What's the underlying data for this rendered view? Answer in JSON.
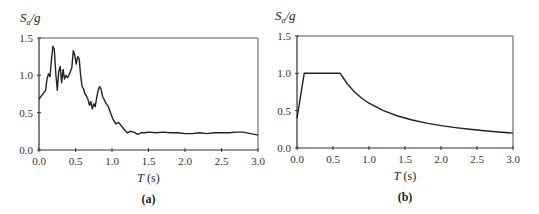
{
  "chart_data": [
    {
      "type": "line",
      "panel_label": "(a)",
      "ylabel": "Sa/g",
      "ylabel_main": "S",
      "ylabel_sub": "a",
      "ylabel_rest": "/g",
      "xlabel_italic": "T",
      "xlabel_rest": " (s)",
      "xlim": [
        0,
        3.0
      ],
      "ylim": [
        0,
        1.5
      ],
      "xticks": [
        "0.0",
        "0.5",
        "1.0",
        "1.5",
        "2.0",
        "2.5",
        "3.0"
      ],
      "yticks": [
        "0.0",
        "0.5",
        "1.0",
        "1.5"
      ],
      "grid": false,
      "x": [
        0.0,
        0.03,
        0.06,
        0.09,
        0.11,
        0.13,
        0.15,
        0.17,
        0.19,
        0.21,
        0.23,
        0.25,
        0.27,
        0.29,
        0.31,
        0.33,
        0.35,
        0.37,
        0.39,
        0.41,
        0.43,
        0.45,
        0.47,
        0.49,
        0.51,
        0.53,
        0.55,
        0.57,
        0.59,
        0.61,
        0.63,
        0.65,
        0.67,
        0.69,
        0.71,
        0.73,
        0.75,
        0.77,
        0.79,
        0.81,
        0.83,
        0.85,
        0.87,
        0.89,
        0.92,
        0.95,
        0.98,
        1.01,
        1.05,
        1.09,
        1.13,
        1.17,
        1.21,
        1.25,
        1.3,
        1.35,
        1.4,
        1.45,
        1.5,
        1.6,
        1.7,
        1.8,
        1.9,
        2.0,
        2.1,
        2.2,
        2.3,
        2.4,
        2.5,
        2.6,
        2.7,
        2.8,
        2.9,
        3.0
      ],
      "values": [
        0.68,
        0.72,
        0.76,
        0.8,
        0.95,
        1.02,
        0.98,
        1.2,
        1.39,
        1.35,
        1.02,
        0.8,
        1.05,
        1.12,
        0.9,
        1.08,
        0.95,
        1.0,
        0.97,
        1.0,
        1.05,
        1.1,
        1.33,
        1.27,
        1.15,
        1.25,
        1.22,
        1.0,
        0.85,
        0.82,
        0.75,
        0.72,
        0.68,
        0.6,
        0.65,
        0.55,
        0.62,
        0.58,
        0.7,
        0.8,
        0.85,
        0.82,
        0.72,
        0.68,
        0.62,
        0.58,
        0.5,
        0.42,
        0.35,
        0.37,
        0.32,
        0.27,
        0.23,
        0.25,
        0.24,
        0.21,
        0.23,
        0.23,
        0.24,
        0.23,
        0.24,
        0.23,
        0.23,
        0.22,
        0.22,
        0.23,
        0.22,
        0.23,
        0.23,
        0.23,
        0.24,
        0.24,
        0.22,
        0.2
      ]
    },
    {
      "type": "line",
      "panel_label": "(b)",
      "ylabel": "Sa/g",
      "ylabel_main": "S",
      "ylabel_sub": "a",
      "ylabel_rest": "/g",
      "xlabel_italic": "T",
      "xlabel_rest": " (s)",
      "xlim": [
        0,
        3.0
      ],
      "ylim": [
        0,
        1.5
      ],
      "xticks": [
        "0.0",
        "0.5",
        "1.0",
        "1.5",
        "2.0",
        "2.5",
        "3.0"
      ],
      "yticks": [
        "0.0",
        "0.5",
        "1.0",
        "1.5"
      ],
      "grid": false,
      "x": [
        0.0,
        0.1,
        0.6,
        0.7,
        0.8,
        0.9,
        1.0,
        1.2,
        1.4,
        1.6,
        1.8,
        2.0,
        2.2,
        2.4,
        2.6,
        2.8,
        3.0
      ],
      "values": [
        0.4,
        1.0,
        1.0,
        0.857,
        0.75,
        0.667,
        0.6,
        0.5,
        0.429,
        0.375,
        0.333,
        0.3,
        0.273,
        0.25,
        0.231,
        0.214,
        0.2
      ]
    }
  ],
  "colors": {
    "line": "#222222",
    "axis": "#333333",
    "frame": "#555555"
  }
}
